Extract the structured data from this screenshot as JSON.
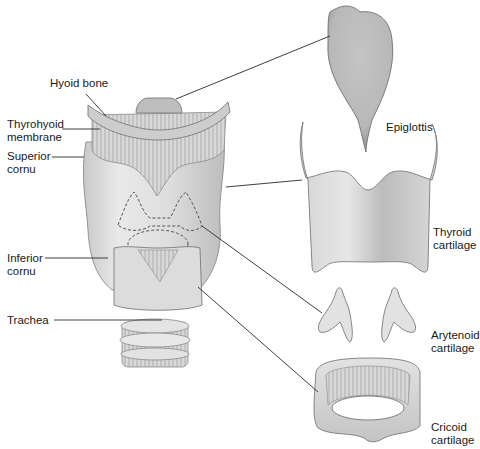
{
  "diagram": {
    "title": "",
    "colors": {
      "cartilage_light": "#e8e8e8",
      "cartilage_mid": "#cfcfcf",
      "cartilage_dark": "#a9a9a9",
      "leader_line": "#2a2a2a",
      "text": "#1a1a1a",
      "background": "#ffffff"
    },
    "labels": {
      "hyoid_bone": "Hyoid bone",
      "thyrohyoid_membrane": "Thyrohyoid\nmembrane",
      "superior_cornu": "Superior\ncornu",
      "inferior_cornu": "Inferior\ncornu",
      "trachea": "Trachea",
      "epiglottis": "Epiglottis",
      "thyroid_cartilage": "Thyroid\ncartilage",
      "arytenoid_cartilage": "Arytenoid\ncartilage",
      "cricoid_cartilage": "Cricoid\ncartilage"
    },
    "parts_left": [
      "Hyoid bone",
      "Thyrohyoid membrane",
      "Superior cornu",
      "Inferior cornu",
      "Trachea"
    ],
    "parts_right": [
      "Epiglottis",
      "Thyroid cartilage",
      "Arytenoid cartilage",
      "Cricoid cartilage"
    ]
  }
}
